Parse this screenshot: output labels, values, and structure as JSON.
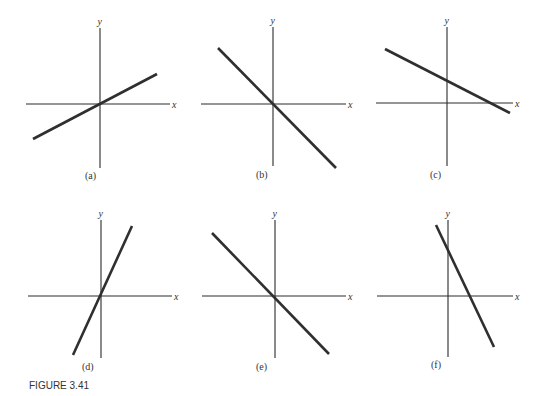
{
  "figure": {
    "caption": "FIGURE 3.41",
    "panels": [
      {
        "label": "(a)",
        "x_label": "x",
        "y_label": "y",
        "slope": "positive",
        "intercept": "origin",
        "yaxis": [
          100,
          28,
          168
        ],
        "xaxis": [
          104,
          26,
          170
        ],
        "line": [
          33,
          139,
          157,
          74
        ],
        "lbl": [
          85,
          179
        ]
      },
      {
        "label": "(b)",
        "x_label": "x",
        "y_label": "y",
        "slope": "negative",
        "intercept": "origin",
        "yaxis": [
          273,
          27,
          166
        ],
        "xaxis": [
          104,
          201,
          346
        ],
        "line": [
          218,
          48,
          336,
          168
        ],
        "lbl": [
          256,
          178
        ]
      },
      {
        "label": "(c)",
        "x_label": "x",
        "y_label": "y",
        "slope": "negative",
        "intercept": "positive y-intercept",
        "yaxis": [
          447,
          27,
          166
        ],
        "xaxis": [
          103,
          376,
          513
        ],
        "line": [
          385,
          49,
          510,
          113
        ],
        "lbl": [
          430,
          178
        ]
      },
      {
        "label": "(d)",
        "x_label": "x",
        "y_label": "y",
        "slope": "steep positive",
        "intercept": "origin",
        "yaxis": [
          101,
          220,
          358
        ],
        "xaxis": [
          296,
          28,
          172
        ],
        "line": [
          73,
          355,
          132,
          226
        ],
        "lbl": [
          82,
          370
        ]
      },
      {
        "label": "(e)",
        "x_label": "x",
        "y_label": "y",
        "slope": "negative",
        "intercept": "origin",
        "yaxis": [
          275,
          220,
          358
        ],
        "xaxis": [
          296,
          202,
          346
        ],
        "line": [
          212,
          233,
          329,
          354
        ],
        "lbl": [
          256,
          370
        ]
      },
      {
        "label": "(f)",
        "x_label": "x",
        "y_label": "y",
        "slope": "steep negative",
        "intercept": "positive y-intercept",
        "yaxis": [
          448,
          220,
          357
        ],
        "xaxis": [
          296,
          377,
          513
        ],
        "line": [
          436,
          225,
          494,
          347
        ],
        "lbl": [
          431,
          368
        ]
      }
    ]
  },
  "colors": {
    "ink": "#2f2f2f",
    "background": "#ffffff"
  }
}
